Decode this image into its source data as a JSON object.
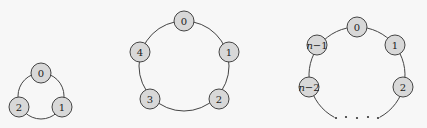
{
  "diagrams": [
    {
      "name": "cycle-3",
      "ring": {
        "cx": 41,
        "cy": 96,
        "r": 23
      },
      "nodes": [
        {
          "label": "0",
          "x": 41,
          "y": 73
        },
        {
          "label": "1",
          "x": 62,
          "y": 107
        },
        {
          "label": "2",
          "x": 19,
          "y": 107
        }
      ]
    },
    {
      "name": "cycle-5",
      "ring": {
        "cx": 184,
        "cy": 66,
        "r": 45
      },
      "nodes": [
        {
          "label": "0",
          "x": 184,
          "y": 21
        },
        {
          "label": "1",
          "x": 229,
          "y": 52
        },
        {
          "label": "2",
          "x": 219,
          "y": 99
        },
        {
          "label": "3",
          "x": 150,
          "y": 99
        },
        {
          "label": "4",
          "x": 140,
          "y": 52
        }
      ]
    },
    {
      "name": "cycle-n",
      "ring": {
        "cx": 357,
        "cy": 75,
        "r": 48
      },
      "nodes": [
        {
          "label": "0",
          "x": 357,
          "y": 27
        },
        {
          "label": "1",
          "x": 395,
          "y": 45
        },
        {
          "label": "2",
          "x": 403,
          "y": 87
        },
        {
          "label": "n−1",
          "x": 317,
          "y": 45
        },
        {
          "label": "n−2",
          "x": 309,
          "y": 87
        }
      ],
      "ellipsis_dots": [
        336,
        346,
        357,
        368,
        378
      ],
      "ellipsis_y": 118
    }
  ],
  "node_radius": 10
}
